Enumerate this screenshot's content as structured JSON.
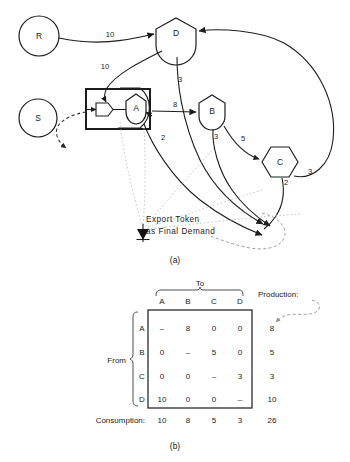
{
  "figure": {
    "panel_a_label": "(a)",
    "panel_b_label": "(b)",
    "nodes": [
      {
        "id": "R",
        "label": "R",
        "shape": "circle"
      },
      {
        "id": "S",
        "label": "S",
        "shape": "circle"
      },
      {
        "id": "A",
        "label": "A",
        "shape": "house"
      },
      {
        "id": "B",
        "label": "B",
        "shape": "house"
      },
      {
        "id": "C",
        "label": "C",
        "shape": "hexagon"
      },
      {
        "id": "D",
        "label": "D",
        "shape": "house"
      }
    ],
    "edge_labels": {
      "r_to_d": "10",
      "d_to_a": "10",
      "d_down": "3",
      "a_to_b": "8",
      "a_export": "2",
      "b_export": "3",
      "b_to_c": "5",
      "c_export": "2",
      "c_to_d": "3"
    },
    "annotation": {
      "line1": "Export Token",
      "line2": "as Final Demand"
    }
  },
  "table": {
    "to_label": "To",
    "from_label": "From",
    "production_label": "Production:",
    "consumption_label": "Consumption:",
    "columns": [
      "A",
      "B",
      "C",
      "D"
    ],
    "rows": [
      "A",
      "B",
      "C",
      "D"
    ],
    "cells": [
      [
        "–",
        "8",
        "0",
        "0"
      ],
      [
        "0",
        "–",
        "5",
        "0"
      ],
      [
        "0",
        "0",
        "–",
        "3"
      ],
      [
        "10",
        "0",
        "0",
        "–"
      ]
    ],
    "production": [
      "8",
      "5",
      "3",
      "10"
    ],
    "consumption": [
      "10",
      "8",
      "5",
      "3"
    ],
    "total": "26"
  }
}
